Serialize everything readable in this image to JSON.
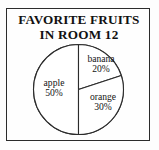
{
  "figure": {
    "frame_color": "#2b2b2b",
    "background_color": "#fefefe"
  },
  "title": {
    "line1": "FAVORITE FRUITS",
    "line2": "IN ROOM 12"
  },
  "chart_data": {
    "type": "pie",
    "title": "FAVORITE FRUITS IN ROOM 12",
    "xlabel": "",
    "ylabel": "",
    "grid": false,
    "legend": "none",
    "labels_inside_slices": true,
    "start_angle_deg_from_top": 0,
    "direction": "clockwise",
    "categories": [
      "banana",
      "orange",
      "apple"
    ],
    "values": [
      20,
      30,
      50
    ],
    "units": "percent",
    "slice_colors": [
      "#ffffff",
      "#ffffff",
      "#ffffff"
    ],
    "outline_color": "#2b2b2b",
    "slices": [
      {
        "name": "banana",
        "percent": 20,
        "label": "banana",
        "value_label": "20%"
      },
      {
        "name": "orange",
        "percent": 30,
        "label": "orange",
        "value_label": "30%"
      },
      {
        "name": "apple",
        "percent": 50,
        "label": "apple",
        "value_label": "50%"
      }
    ]
  }
}
